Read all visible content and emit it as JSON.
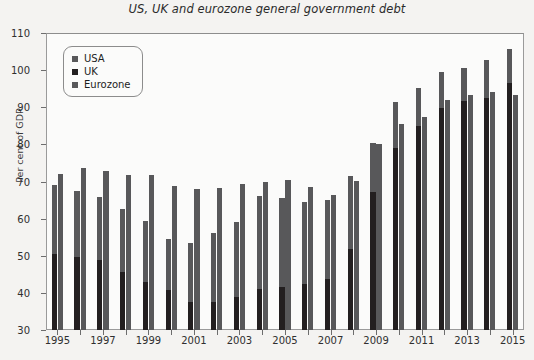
{
  "chart_data": {
    "type": "bar",
    "title": "US, UK and eurozone general government debt",
    "xlabel": "",
    "ylabel": "Per cent of GDP",
    "ylim": [
      30,
      110
    ],
    "ytick_labels": [
      "30",
      "40",
      "50",
      "60",
      "70",
      "80",
      "90",
      "100",
      "110"
    ],
    "yticks": [
      30,
      40,
      50,
      60,
      70,
      80,
      90,
      100,
      110
    ],
    "grid": false,
    "legend_position": "upper-left",
    "categories": [
      "1995",
      "1996",
      "1997",
      "1998",
      "1999",
      "2000",
      "2001",
      "2002",
      "2003",
      "2004",
      "2005",
      "2006",
      "2007",
      "2008",
      "2009",
      "2010",
      "2011",
      "2012",
      "2013",
      "2014",
      "2015"
    ],
    "xtick_labels": [
      "1995",
      "1997",
      "1999",
      "2001",
      "2003",
      "2005",
      "2007",
      "2009",
      "2011",
      "2013",
      "2015"
    ],
    "series": [
      {
        "name": "USA",
        "color": "#58585a",
        "values": [
          69.0,
          67.4,
          65.9,
          62.7,
          59.3,
          54.5,
          53.4,
          56.1,
          59.0,
          66.0,
          65.5,
          64.6,
          65.0,
          71.5,
          80.5,
          91.5,
          95.3,
          99.4,
          100.6,
          102.6,
          105.8
        ]
      },
      {
        "name": "UK",
        "color": "#231f20",
        "values": [
          50.4,
          49.6,
          48.8,
          45.7,
          43.0,
          40.7,
          37.5,
          37.5,
          38.8,
          41.0,
          41.5,
          42.4,
          43.8,
          51.9,
          67.1,
          78.9,
          84.9,
          89.7,
          91.7,
          92.5,
          96.5
        ]
      },
      {
        "name": "Eurozone",
        "color": "#58585a",
        "values": [
          72.0,
          73.6,
          72.7,
          71.8,
          71.7,
          68.9,
          68.0,
          68.2,
          69.4,
          70.0,
          70.4,
          68.5,
          66.3,
          70.1,
          80.0,
          85.4,
          87.5,
          92.0,
          93.4,
          94.0,
          93.2
        ]
      }
    ]
  },
  "legend": {
    "items": [
      {
        "label": "USA",
        "color": "#58585a"
      },
      {
        "label": "UK",
        "color": "#231f20"
      },
      {
        "label": "Eurozone",
        "color": "#58585a"
      }
    ]
  }
}
